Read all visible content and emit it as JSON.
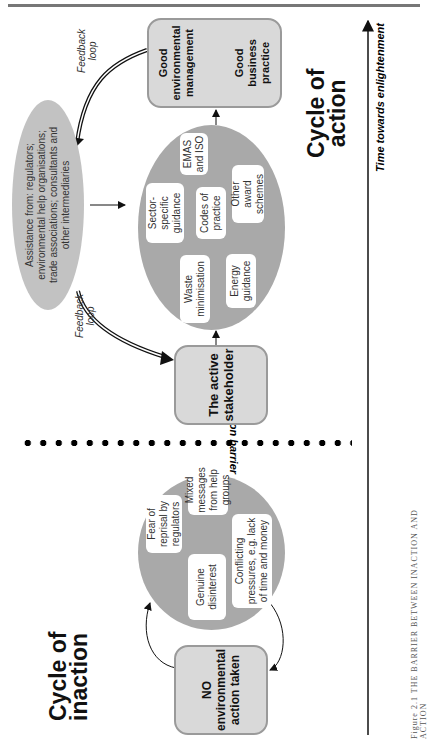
{
  "cycle_of_inaction": {
    "label_line1": "Cycle of",
    "label_line2": "inaction",
    "start_box": {
      "line1": "NO",
      "line2": "environmental",
      "line3": "action taken"
    },
    "barriers": [
      {
        "text": "Fear of reprisal by regulators"
      },
      {
        "text": "Mixed messages from help groups"
      },
      {
        "text": "Genuine disinterest"
      },
      {
        "text": "Conflicting pressures, e.g. lack of time and money"
      }
    ]
  },
  "action_barrier": {
    "label": "Action barrier"
  },
  "cycle_of_action": {
    "label_line1": "Cycle of",
    "label_line2": "action",
    "stakeholder_box": {
      "line1": "The active",
      "line2": "stakeholder"
    },
    "tools": [
      {
        "text": "Waste minimisation"
      },
      {
        "text": "Energy guidance"
      },
      {
        "text": "Sector-specific guidance"
      },
      {
        "text": "Codes of practice"
      },
      {
        "text": "EMAS and ISO"
      },
      {
        "text": "Other award schemes"
      }
    ],
    "assistance": {
      "text": "Assistance from: regulators; environmental help organisations; trade associations; consultants and other intermediaries"
    },
    "outcome_box": {
      "left": "Good environmental management",
      "right": "Good business practice"
    },
    "feedback_label_1": "Feedback loop",
    "feedback_label_2": "Feedback loop"
  },
  "time_axis": {
    "label": "Time towards enlightenment"
  },
  "caption": {
    "text": "Figure 2.1 THE BARRIER BETWEEN INACTION AND ACTION"
  }
}
